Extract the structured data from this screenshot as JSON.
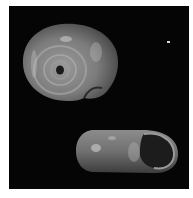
{
  "figure": {
    "views": [
      {
        "name": "umbilical view",
        "kind": "apical/basal view showing umbilicus"
      },
      {
        "name": "apertural view",
        "kind": "side view showing aperture"
      }
    ],
    "colors": {
      "background": "#050505",
      "border": "#ffffff",
      "shell_light": "#b8b8b8",
      "shell_mid": "#7a7a7a",
      "shell_dark": "#3a3a3a"
    }
  }
}
